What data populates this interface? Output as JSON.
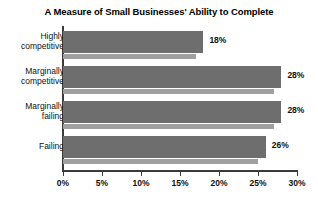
{
  "chart_data": {
    "type": "bar",
    "orientation": "horizontal",
    "title": "A Measure of Small Businesses' Ability to Complete",
    "xlabel": "",
    "ylabel": "",
    "xlim": [
      0,
      30
    ],
    "xticks": [
      "0%",
      "5%",
      "10%",
      "15%",
      "20%",
      "25%",
      "30%"
    ],
    "xtick_values": [
      0,
      5,
      10,
      15,
      20,
      25,
      30
    ],
    "grid": false,
    "legend": "none",
    "categories": [
      "Highly\ncompetitive",
      "Marginally\ncompetitive",
      "Marginally\nfailing",
      "Failing"
    ],
    "series": [
      {
        "name": "primary",
        "color": "#6e6e6e",
        "values": [
          18,
          28,
          28,
          26
        ],
        "labels": [
          "18%",
          "28%",
          "28%",
          "26%"
        ]
      },
      {
        "name": "secondary",
        "color": "#a0a0a0",
        "values": [
          17,
          27,
          27,
          25
        ],
        "labels": [
          "",
          "",
          "",
          ""
        ]
      }
    ]
  },
  "colors": {
    "primary_bar": "#6e6e6e",
    "secondary_bar": "#a0a0a0",
    "axis": "#3b3b3b",
    "text": "#111111",
    "background": "#ffffff"
  }
}
